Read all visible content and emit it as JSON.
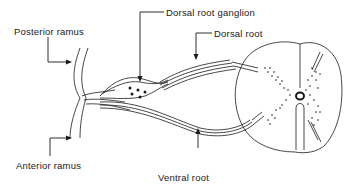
{
  "diagram": {
    "labels": {
      "posterior_ramus": "Posterior ramus",
      "dorsal_root_ganglion": "Dorsal root ganglion",
      "dorsal_root": "Dorsal root",
      "anterior_ramus": "Anterior ramus",
      "ventral_root": "Ventral root"
    },
    "colors": {
      "line": "#1a1a1a",
      "background": "#ffffff"
    }
  }
}
